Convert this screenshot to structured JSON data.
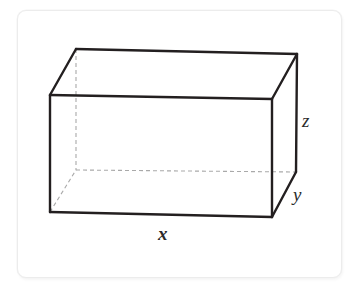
{
  "figure": {
    "kind": "rectangular-prism-diagram",
    "caption": "",
    "background_color": "#ffffff",
    "card": {
      "background_color": "#ffffff",
      "border_color": "#ececec"
    },
    "stroke": {
      "visible_edge_color": "#231f20",
      "hidden_edge_color": "#a9a9a9",
      "visible_edge_width": 2.4,
      "hidden_edge_width": 1.1,
      "hidden_edge_dash": "4 3"
    },
    "labels": {
      "x": "x",
      "y": "y",
      "z": "z"
    },
    "vertices": {
      "front_top_left": [
        50,
        95
      ],
      "front_top_right": [
        272,
        99
      ],
      "front_bottom_left": [
        50,
        212
      ],
      "front_bottom_right": [
        272,
        217
      ],
      "back_top_left": [
        76,
        49
      ],
      "back_top_right": [
        297,
        54
      ],
      "back_bottom_left": [
        76,
        170
      ],
      "back_bottom_right": [
        296,
        172
      ]
    },
    "edges": [
      {
        "name": "front-top",
        "from": "front_top_left",
        "to": "front_top_right",
        "hidden": false
      },
      {
        "name": "front-right",
        "from": "front_top_right",
        "to": "front_bottom_right",
        "hidden": false
      },
      {
        "name": "front-bottom",
        "from": "front_bottom_right",
        "to": "front_bottom_left",
        "hidden": false
      },
      {
        "name": "front-left",
        "from": "front_bottom_left",
        "to": "front_top_left",
        "hidden": false
      },
      {
        "name": "top-back",
        "from": "back_top_left",
        "to": "back_top_right",
        "hidden": false
      },
      {
        "name": "top-left-diagonal",
        "from": "front_top_left",
        "to": "back_top_left",
        "hidden": false
      },
      {
        "name": "top-right-diagonal",
        "from": "front_top_right",
        "to": "back_top_right",
        "hidden": false
      },
      {
        "name": "back-right-vertical",
        "from": "back_top_right",
        "to": "back_bottom_right",
        "hidden": false
      },
      {
        "name": "bottom-right-diagonal",
        "from": "front_bottom_right",
        "to": "back_bottom_right",
        "hidden": false
      },
      {
        "name": "back-left-vertical",
        "from": "back_top_left",
        "to": "back_bottom_left",
        "hidden": true
      },
      {
        "name": "back-bottom",
        "from": "back_bottom_left",
        "to": "back_bottom_right",
        "hidden": true
      },
      {
        "name": "bottom-left-diagonal",
        "from": "front_bottom_left",
        "to": "back_bottom_left",
        "hidden": true
      }
    ]
  }
}
